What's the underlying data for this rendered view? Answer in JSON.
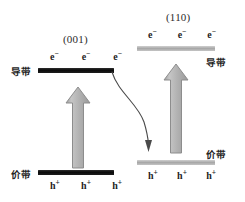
{
  "diagram": {
    "title_left": "(001)",
    "title_right": "(110)",
    "panels": {
      "left": {
        "facet": "(001)",
        "conduction_band_label": "导带",
        "valence_band_label": "价带",
        "electrons": [
          "e",
          "e",
          "e"
        ],
        "holes": [
          "h",
          "h",
          "h"
        ],
        "electron_charge": "−",
        "hole_charge": "+",
        "bar_color": "#0b0b0b",
        "arrow_direction": "up"
      },
      "right": {
        "facet": "(110)",
        "conduction_band_label": "导带",
        "valence_band_label": "价带",
        "electrons": [
          "e",
          "e",
          "e"
        ],
        "holes": [
          "h",
          "h",
          "h"
        ],
        "electron_charge": "−",
        "hole_charge": "+",
        "bar_color": "#a8a8a8",
        "arrow_direction": "up"
      }
    },
    "transfer_arrow": {
      "name": "charge-transfer-arrow",
      "from": "left-conduction-band",
      "to": "right-valence-band",
      "color": "#4a4a4a"
    },
    "colors": {
      "background": "#ffffff",
      "text": "#242424",
      "dark_band": "#0b0b0b",
      "light_band": "#a8a8a8",
      "arrow_fill": "#b0b0b0",
      "arrow_stroke": "#8f8f8f"
    }
  }
}
